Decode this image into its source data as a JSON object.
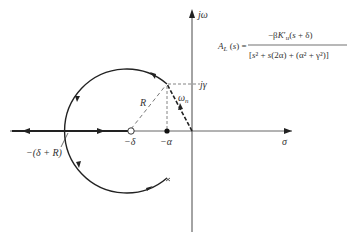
{
  "figure": {
    "axes": {
      "imag_label": "jω",
      "real_label": "σ"
    },
    "labels": {
      "j_gamma": "jγ",
      "omega_n": "ωn",
      "radius": "R",
      "minus_delta": "−δ",
      "minus_alpha": "−α",
      "breakaway": "−(δ + R)"
    },
    "equation": {
      "lhs": "AL(s) =",
      "numerator": "−βK′u(s + δ)",
      "denominator": "[s² + s(2α) + (α² + γ²)]"
    },
    "colors": {
      "ink": "#222222",
      "dashed": "#555555",
      "background": "#ffffff"
    }
  }
}
